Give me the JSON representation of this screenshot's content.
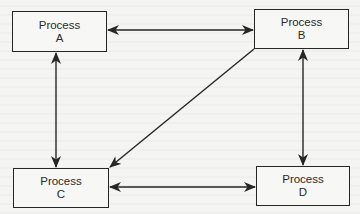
{
  "diagram": {
    "type": "flow",
    "nodes": [
      {
        "id": "A",
        "title": "Process",
        "letter": "A",
        "box": {
          "x": 12,
          "y": 11,
          "w": 95,
          "h": 41
        }
      },
      {
        "id": "B",
        "title": "Process",
        "letter": "B",
        "box": {
          "x": 254,
          "y": 9,
          "w": 95,
          "h": 40
        }
      },
      {
        "id": "C",
        "title": "Process",
        "letter": "C",
        "box": {
          "x": 13,
          "y": 168,
          "w": 96,
          "h": 40
        }
      },
      {
        "id": "D",
        "title": "Process",
        "letter": "D",
        "box": {
          "x": 256,
          "y": 166,
          "w": 94,
          "h": 40
        }
      }
    ],
    "edges": [
      {
        "from": "A",
        "to": "B",
        "direction": "bidirectional"
      },
      {
        "from": "A",
        "to": "C",
        "direction": "bidirectional"
      },
      {
        "from": "B",
        "to": "D",
        "direction": "bidirectional"
      },
      {
        "from": "C",
        "to": "D",
        "direction": "bidirectional"
      },
      {
        "from": "B",
        "to": "C",
        "direction": "one-way"
      }
    ],
    "colors": {
      "line": "#262626",
      "text": "#2a2a2a",
      "background": "#f4f4f2"
    }
  }
}
